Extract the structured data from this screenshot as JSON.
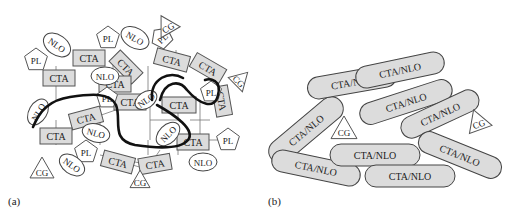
{
  "panels": [
    {
      "id": "a",
      "label": "(a)",
      "x": 8,
      "y": 205
    },
    {
      "id": "b",
      "label": "(b)",
      "x": 268,
      "y": 205
    }
  ],
  "panel_a": {
    "links": [
      [
        56,
        78,
        56,
        66
      ],
      [
        56,
        78,
        56,
        100
      ],
      [
        113,
        65,
        113,
        80
      ],
      [
        148,
        66,
        148,
        100
      ],
      [
        176,
        50,
        176,
        62
      ],
      [
        150,
        100,
        150,
        120
      ],
      [
        178,
        100,
        178,
        120
      ],
      [
        178,
        120,
        150,
        120
      ],
      [
        150,
        120,
        150,
        140
      ],
      [
        87,
        120,
        130,
        105
      ],
      [
        56,
        120,
        56,
        145
      ],
      [
        100,
        120,
        100,
        145
      ],
      [
        148,
        140,
        148,
        155
      ],
      [
        200,
        100,
        200,
        140
      ],
      [
        200,
        140,
        220,
        140
      ],
      [
        190,
        120,
        210,
        120
      ],
      [
        210,
        85,
        228,
        92
      ],
      [
        178,
        135,
        178,
        155
      ],
      [
        160,
        150,
        150,
        165
      ],
      [
        100,
        155,
        150,
        165
      ],
      [
        115,
        160,
        150,
        170
      ]
    ],
    "thick_curves": [
      "M 33 127 C 40 110, 50 100, 70 97 C 90 94, 110 92, 116 105 C 122 120, 110 140, 135 145 C 155 148, 180 150, 188 140 C 196 130, 175 115, 157 105",
      "M 160 100 C 165 80, 180 80, 187 90 C 200 105, 215 110, 218 95 C 222 80, 210 78, 205 80",
      "M 152 100 C 150 78, 170 70, 183 78"
    ],
    "cta_boxes": [
      {
        "cx": 59,
        "cy": 78,
        "w": 32,
        "h": 16,
        "rot": 0,
        "text": "CTA"
      },
      {
        "cx": 89,
        "cy": 58,
        "w": 32,
        "h": 16,
        "rot": 0,
        "text": "CTA"
      },
      {
        "cx": 126,
        "cy": 67,
        "w": 32,
        "h": 16,
        "rot": 45,
        "text": "CTA"
      },
      {
        "cx": 172,
        "cy": 60,
        "w": 34,
        "h": 16,
        "rot": 15,
        "text": "CTA"
      },
      {
        "cx": 208,
        "cy": 68,
        "w": 34,
        "h": 16,
        "rot": 30,
        "text": "CTA"
      },
      {
        "cx": 86,
        "cy": 118,
        "w": 32,
        "h": 16,
        "rot": -15,
        "text": "CTA"
      },
      {
        "cx": 130,
        "cy": 102,
        "w": 32,
        "h": 16,
        "rot": 0,
        "text": "CTA"
      },
      {
        "cx": 179,
        "cy": 105,
        "w": 34,
        "h": 16,
        "rot": 0,
        "text": "CTA"
      },
      {
        "cx": 56,
        "cy": 136,
        "w": 32,
        "h": 16,
        "rot": 0,
        "text": "CTA"
      },
      {
        "cx": 222,
        "cy": 101,
        "w": 30,
        "h": 16,
        "rot": 80,
        "text": "CTA"
      },
      {
        "cx": 193,
        "cy": 142,
        "w": 32,
        "h": 16,
        "rot": 0,
        "text": "CTA"
      },
      {
        "cx": 118,
        "cy": 162,
        "w": 32,
        "h": 16,
        "rot": 15,
        "text": "CTA"
      },
      {
        "cx": 155,
        "cy": 164,
        "w": 32,
        "h": 16,
        "rot": -10,
        "text": "CTA"
      },
      {
        "cx": 115,
        "cy": 84,
        "w": 32,
        "h": 16,
        "rot": 0,
        "text": "CTA"
      }
    ],
    "pl_shapes": [
      {
        "cx": 36,
        "cy": 60,
        "r": 12,
        "text": "PL"
      },
      {
        "cx": 108,
        "cy": 38,
        "r": 12,
        "text": "PL"
      },
      {
        "cx": 162,
        "cy": 38,
        "r": 11,
        "rot": -45,
        "text": "PL"
      },
      {
        "cx": 107,
        "cy": 98,
        "r": 11,
        "text": "PL"
      },
      {
        "cx": 211,
        "cy": 92,
        "r": 11,
        "text": "PL"
      },
      {
        "cx": 86,
        "cy": 152,
        "r": 12,
        "text": "PL"
      },
      {
        "cx": 228,
        "cy": 140,
        "r": 12,
        "text": "PL"
      }
    ],
    "nlo_ellipses": [
      {
        "cx": 57,
        "cy": 45,
        "rx": 15,
        "ry": 10,
        "rot": 35,
        "text": "NLO"
      },
      {
        "cx": 135,
        "cy": 38,
        "rx": 15,
        "ry": 10,
        "rot": 30,
        "text": "NLO"
      },
      {
        "cx": 105,
        "cy": 76,
        "rx": 14,
        "ry": 9,
        "rot": 0,
        "text": "NLO"
      },
      {
        "cx": 38,
        "cy": 112,
        "rx": 14,
        "ry": 9,
        "rot": -60,
        "text": "NLO"
      },
      {
        "cx": 96,
        "cy": 133,
        "rx": 14,
        "ry": 9,
        "rot": 15,
        "text": "NLO"
      },
      {
        "cx": 146,
        "cy": 100,
        "rx": 12,
        "ry": 8,
        "rot": -35,
        "text": "NLO"
      },
      {
        "cx": 72,
        "cy": 165,
        "rx": 14,
        "ry": 9,
        "rot": 35,
        "text": "NLO"
      },
      {
        "cx": 168,
        "cy": 134,
        "rx": 14,
        "ry": 9,
        "rot": -45,
        "text": "NLO"
      },
      {
        "cx": 203,
        "cy": 162,
        "rx": 14,
        "ry": 9,
        "rot": 0,
        "text": "NLO"
      }
    ],
    "cg_triangles": [
      {
        "cx": 167,
        "cy": 26,
        "size": 22,
        "rot": -30,
        "text": "CG"
      },
      {
        "cx": 240,
        "cy": 80,
        "size": 20,
        "rot": 45,
        "text": "CG"
      },
      {
        "cx": 42,
        "cy": 170,
        "size": 24,
        "rot": 0,
        "text": "CG"
      },
      {
        "cx": 140,
        "cy": 181,
        "size": 20,
        "rot": 0,
        "text": "CG"
      }
    ]
  },
  "panel_b": {
    "pills": [
      {
        "cx": 306,
        "cy": 130,
        "w": 90,
        "h": 24,
        "rot": -40,
        "text": "CTA/NLO"
      },
      {
        "cx": 352,
        "cy": 82,
        "w": 90,
        "h": 22,
        "rot": -10,
        "text": "CTA/NLO"
      },
      {
        "cx": 400,
        "cy": 70,
        "w": 90,
        "h": 22,
        "rot": -12,
        "text": "CTA/NLO"
      },
      {
        "cx": 406,
        "cy": 102,
        "w": 96,
        "h": 22,
        "rot": -18,
        "text": "CTA/NLO"
      },
      {
        "cx": 440,
        "cy": 114,
        "w": 84,
        "h": 22,
        "rot": -25,
        "text": "CTA/NLO"
      },
      {
        "cx": 316,
        "cy": 168,
        "w": 90,
        "h": 22,
        "rot": 12,
        "text": "CTA/NLO"
      },
      {
        "cx": 375,
        "cy": 155,
        "w": 90,
        "h": 22,
        "rot": 0,
        "text": "CTA/NLO"
      },
      {
        "cx": 410,
        "cy": 176,
        "w": 90,
        "h": 22,
        "rot": 0,
        "text": "CTA/NLO"
      },
      {
        "cx": 460,
        "cy": 155,
        "w": 88,
        "h": 22,
        "rot": 22,
        "text": "CTA/NLO"
      }
    ],
    "cg_triangles": [
      {
        "cx": 344,
        "cy": 130,
        "size": 26,
        "rot": 0,
        "text": "CG"
      },
      {
        "cx": 478,
        "cy": 122,
        "size": 24,
        "rot": -20,
        "text": "CG"
      }
    ]
  }
}
